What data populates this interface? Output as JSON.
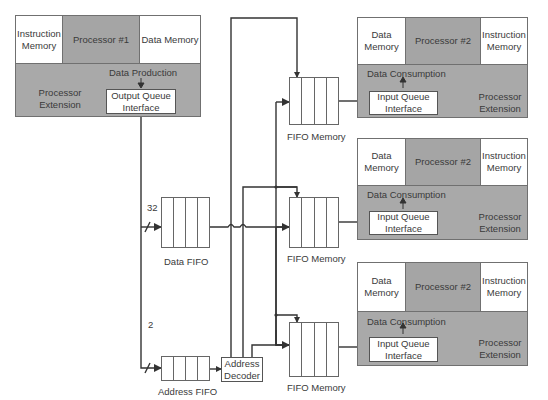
{
  "producer": {
    "instruction_memory": "Instruction Memory",
    "processor": "Processor #1",
    "data_memory": "Data Memory",
    "data_production": "Data Production",
    "processor_extension": "Processor Extension",
    "output_queue": "Output Queue Interface"
  },
  "consumers": [
    {
      "data_memory": "Data Memory",
      "processor": "Processor #2",
      "instruction_memory": "Instruction Memory",
      "data_consumption": "Data Consumption",
      "input_queue": "Input Queue Interface",
      "processor_extension": "Processor Extension"
    },
    {
      "data_memory": "Data Memory",
      "processor": "Processor #2",
      "instruction_memory": "Instruction Memory",
      "data_consumption": "Data Consumption",
      "input_queue": "Input Queue Interface",
      "processor_extension": "Processor Extension"
    },
    {
      "data_memory": "Data Memory",
      "processor": "Processor #2",
      "instruction_memory": "Instruction Memory",
      "data_consumption": "Data Consumption",
      "input_queue": "Input Queue Interface",
      "processor_extension": "Processor Extension"
    }
  ],
  "data_fifo": {
    "label": "Data FIFO",
    "bus_width": "32"
  },
  "address_fifo": {
    "label": "Address FIFO",
    "bus_width": "2"
  },
  "address_decoder": "Address Decoder",
  "fifo_memories": [
    {
      "label": "FIFO Memory"
    },
    {
      "label": "FIFO Memory"
    },
    {
      "label": "FIFO Memory"
    }
  ]
}
